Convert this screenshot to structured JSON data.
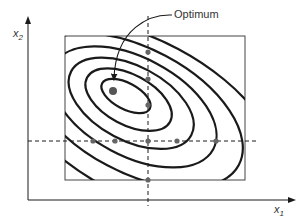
{
  "figure": {
    "type": "contour-plot-one-factor-at-a-time",
    "annotation": "Optimum",
    "x_axis": {
      "label_base": "x",
      "label_sub": "1"
    },
    "y_axis": {
      "label_base": "x",
      "label_sub": "2"
    },
    "optimum_point": {
      "x": 113,
      "y": 91
    },
    "design_box": {
      "x1": 65,
      "y1": 36,
      "x2": 245,
      "y2": 180
    },
    "vertical_dashed_line_x": 148,
    "horizontal_dashed_line_y": 141,
    "points_on_vertical_line": [
      52,
      79,
      105,
      141,
      180
    ],
    "points_on_horizontal_line": [
      93,
      115,
      148,
      177,
      216
    ],
    "contour_count": 6,
    "colors": {
      "line": "#1a1a1a",
      "box": "#444444",
      "point": "#666666",
      "text": "#333333"
    }
  }
}
